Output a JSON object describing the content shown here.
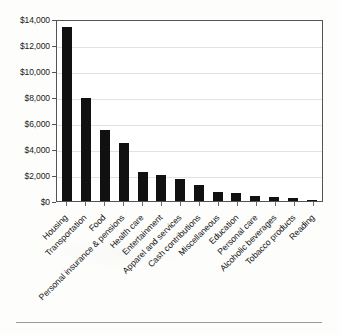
{
  "chart_data": {
    "type": "bar",
    "title": "",
    "subtitle": "",
    "xlabel": "",
    "ylabel": "",
    "ylim": [
      0,
      14000
    ],
    "grid": true,
    "legend": "none",
    "orientation": "vertical",
    "bar_color": "#111111",
    "categories": [
      "Housing",
      "Transportation",
      "Food",
      "Personal insurance & pensions",
      "Health care",
      "Entertainment",
      "Apparel and services",
      "Cash contributions",
      "Miscellaneous",
      "Education",
      "Personal care",
      "Alcoholic beverages",
      "Tobacco products",
      "Reading"
    ],
    "values": [
      13400,
      7900,
      5450,
      4450,
      2250,
      2000,
      1700,
      1250,
      700,
      650,
      400,
      300,
      250,
      100
    ],
    "ytick_labels": [
      "$0",
      "$2,000",
      "$4,000",
      "$6,000",
      "$8,000",
      "$10,000",
      "$12,000",
      "$14,000"
    ],
    "ytick_values": [
      0,
      2000,
      4000,
      6000,
      8000,
      10000,
      12000,
      14000
    ]
  }
}
